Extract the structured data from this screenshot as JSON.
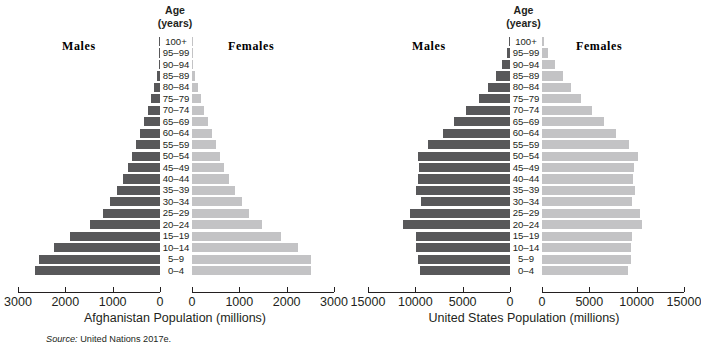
{
  "figure": {
    "source_note_prefix": "Source:",
    "source_note": "United Nations 2017e."
  },
  "labels": {
    "age_line1": "Age",
    "age_line2": "(years)",
    "males": "Males",
    "females": "Females"
  },
  "age_groups": [
    "100+",
    "95–99",
    "90–94",
    "85–89",
    "80–84",
    "75–79",
    "70–74",
    "65–69",
    "60–64",
    "55–59",
    "50–54",
    "45–49",
    "40–44",
    "35–39",
    "30–34",
    "25–29",
    "20–24",
    "15–19",
    "10–14",
    "5–9",
    "0–4"
  ],
  "colors": {
    "male_bar": "#58585a",
    "female_bar": "#c3c3c5",
    "axis": "#231f20",
    "text": "#231f20",
    "background": "#ffffff"
  },
  "chart_data": [
    {
      "type": "bar",
      "orientation": "population-pyramid",
      "title": "Afghanistan Population (millions)",
      "xlabel": "Afghanistan Population (millions)",
      "ylabel": "Age (years)",
      "categories": [
        "100+",
        "95–99",
        "90–94",
        "85–89",
        "80–84",
        "75–79",
        "70–74",
        "65–69",
        "60–64",
        "55–59",
        "50–54",
        "45–49",
        "40–44",
        "35–39",
        "30–34",
        "25–29",
        "20–24",
        "15–19",
        "10–14",
        "5–9",
        "0–4"
      ],
      "xlim": [
        0,
        3000
      ],
      "xticks": [
        3000,
        2000,
        1000,
        0
      ],
      "xticks_right": [
        0,
        1000,
        2000,
        3000
      ],
      "grid": false,
      "legend": [
        "Males",
        "Females"
      ],
      "legend_position": "top",
      "series": [
        {
          "name": "Males",
          "side": "left",
          "color": "#58585a",
          "values": [
            2,
            8,
            25,
            60,
            120,
            185,
            260,
            340,
            420,
            505,
            590,
            680,
            790,
            910,
            1060,
            1210,
            1480,
            1900,
            2250,
            2560,
            2640
          ]
        },
        {
          "name": "Females",
          "side": "right",
          "color": "#c3c3c5",
          "values": [
            2,
            8,
            25,
            60,
            120,
            185,
            260,
            340,
            420,
            505,
            590,
            680,
            790,
            910,
            1060,
            1210,
            1480,
            1880,
            2230,
            2510,
            2520
          ]
        }
      ]
    },
    {
      "type": "bar",
      "orientation": "population-pyramid",
      "title": "United States Population (millions)",
      "xlabel": "United States Population (millions)",
      "ylabel": "Age (years)",
      "categories": [
        "100+",
        "95–99",
        "90–94",
        "85–89",
        "80–84",
        "75–79",
        "70–74",
        "65–69",
        "60–64",
        "55–59",
        "50–54",
        "45–49",
        "40–44",
        "35–39",
        "30–34",
        "25–29",
        "20–24",
        "15–19",
        "10–14",
        "5–9",
        "0–4"
      ],
      "xlim": [
        0,
        15000
      ],
      "xticks": [
        15000,
        10000,
        5000,
        0
      ],
      "xticks_right": [
        0,
        5000,
        10000,
        15000
      ],
      "grid": false,
      "legend": [
        "Males",
        "Females"
      ],
      "legend_position": "top",
      "series": [
        {
          "name": "Males",
          "side": "left",
          "color": "#58585a",
          "values": [
            90,
            330,
            840,
            1500,
            2300,
            3300,
            4600,
            5900,
            7100,
            8700,
            9700,
            9600,
            9750,
            9900,
            9400,
            10600,
            11300,
            9900,
            9900,
            9750,
            9500
          ]
        },
        {
          "name": "Females",
          "side": "right",
          "color": "#c3c3c5",
          "values": [
            190,
            620,
            1350,
            2200,
            3100,
            4100,
            5300,
            6500,
            7800,
            9200,
            10100,
            9700,
            9600,
            9800,
            9500,
            10400,
            10600,
            9500,
            9450,
            9400,
            9100
          ]
        }
      ]
    }
  ]
}
